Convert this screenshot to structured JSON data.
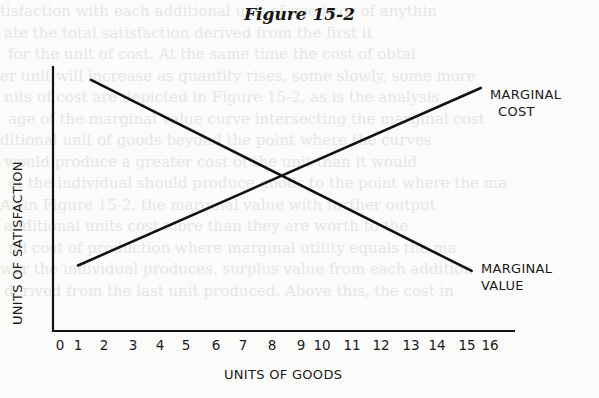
{
  "figure": {
    "title": "Figure 15-2"
  },
  "chart_data": {
    "type": "line",
    "title": "Figure 15-2",
    "xlabel": "UNITS OF GOODS",
    "ylabel": "UNITS OF SATISFACTION",
    "x_ticks": [
      "0",
      "1",
      "2",
      "3",
      "4",
      "5",
      "6",
      "7",
      "8",
      "9",
      "10",
      "11",
      "12",
      "13",
      "14",
      "15",
      "16"
    ],
    "xlim": [
      0,
      16
    ],
    "ylim": [
      0,
      10
    ],
    "grid": false,
    "legend": "inline labels at right end of lines",
    "series": [
      {
        "name": "MARGINAL COST",
        "label_lines": [
          "MARGINAL",
          "COST"
        ],
        "x": [
          1.0,
          15.6
        ],
        "y": [
          2.4,
          8.9
        ]
      },
      {
        "name": "MARGINAL VALUE",
        "label_lines": [
          "MARGINAL",
          "VALUE"
        ],
        "x": [
          1.5,
          15.2
        ],
        "y": [
          9.2,
          2.2
        ]
      }
    ],
    "annotations": [
      {
        "type": "intersection",
        "x": 8.3,
        "y": 5.7
      }
    ]
  },
  "bleed_text": [
    "tisfaction with each additional unit of goods or of anythin",
    "ate the total satisfaction derived from the first it",
    "for the unit of cost. At the same time the cost of obtai",
    "er unit will increase as quantity rises, some slowly, some more",
    "nits of cost are depicted in Figure 15-2, as is the analysis",
    "age of the marginal value curve intersecting the marginal cost",
    "ditional unit of goods beyond the point where the curves",
    "would produce a greater cost of the unit than it would",
    "ot the individual should produce goods to the point where the ma",
    "As in Figure 15-2, the marginal value with further output",
    "additional units cost more than they are worth to the",
    "nd cost of production where marginal utility equals the ma",
    "wer the individual produces, surplus value from each addition",
    "derived from the last unit produced. Above this, the cost in"
  ]
}
